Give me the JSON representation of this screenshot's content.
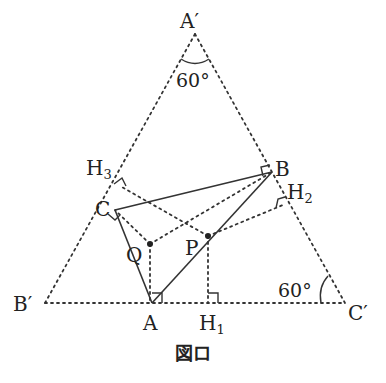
{
  "diagram": {
    "caption": "図ロ",
    "points": {
      "A_prime": {
        "label": "A′",
        "x": 195,
        "y": 32
      },
      "B_prime": {
        "label": "B′",
        "x": 45,
        "y": 303
      },
      "C_prime": {
        "label": "C′",
        "x": 345,
        "y": 303
      },
      "A": {
        "label": "A",
        "x": 152,
        "y": 303
      },
      "B": {
        "label": "B",
        "x": 272,
        "y": 172
      },
      "C": {
        "label": "C",
        "x": 115,
        "y": 210
      },
      "P": {
        "label": "P",
        "x": 208,
        "y": 236
      },
      "Q": {
        "label": "Q",
        "x": 150,
        "y": 244
      },
      "H1": {
        "label": "H",
        "sub": "1",
        "x": 208,
        "y": 303
      },
      "H2": {
        "label": "H",
        "sub": "2",
        "x": 283,
        "y": 205
      },
      "H3": {
        "label": "H",
        "sub": "3",
        "x": 120,
        "y": 186
      }
    },
    "angles": {
      "top": "60°",
      "bottom_right": "60°"
    },
    "colors": {
      "line": "#333333",
      "background": "#ffffff"
    }
  }
}
